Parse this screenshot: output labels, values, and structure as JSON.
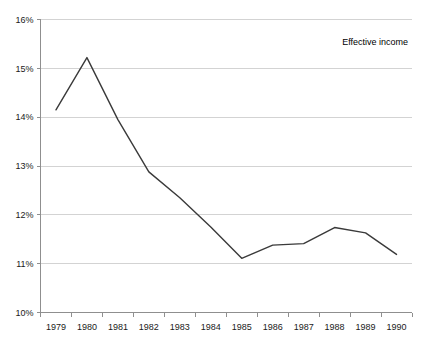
{
  "chart_data": {
    "type": "line",
    "title": "",
    "xlabel": "",
    "ylabel": "",
    "categories": [
      "1979",
      "1980",
      "1981",
      "1982",
      "1983",
      "1984",
      "1985",
      "1986",
      "1987",
      "1988",
      "1989",
      "1990"
    ],
    "series": [
      {
        "name": "Effective income",
        "values": [
          14.15,
          15.22,
          13.95,
          12.88,
          12.35,
          11.75,
          11.11,
          11.38,
          11.41,
          11.74,
          11.63,
          11.19
        ]
      }
    ],
    "ylim": [
      10,
      16
    ],
    "ytick_values": [
      10,
      11,
      12,
      13,
      14,
      15,
      16
    ],
    "ytick_labels": [
      "10%",
      "11%",
      "12%",
      "13%",
      "14%",
      "15%",
      "16%"
    ],
    "grid": true,
    "legend_position": "top-right",
    "value_unit": "%",
    "line_color": "#3a3a3a",
    "grid_color": "#c8c8c8",
    "axis_color": "#8f8f8f",
    "text_color": "#1a1a1a"
  },
  "legend": {
    "entries": [
      {
        "label": "Effective income"
      }
    ]
  }
}
